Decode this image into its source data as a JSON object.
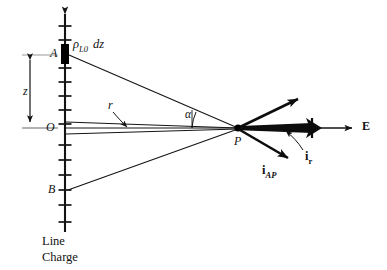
{
  "figure": {
    "background": "#ffffff",
    "ink": "#111111"
  },
  "labels": {
    "point_a": "A",
    "point_o": "O",
    "point_b": "B",
    "point_p": "P",
    "charge_element_rho": "ρ",
    "charge_element_sub": "L0",
    "charge_element_dz": "dz",
    "distance_z": "z",
    "distance_r": "r",
    "angle_alpha": "α",
    "unit_vector_ir": "i",
    "unit_vector_ir_sub": "r",
    "unit_vector_iap": "i",
    "unit_vector_iap_sub": "AP",
    "field_e": "E",
    "caption_line1": "Line",
    "caption_line2": "Charge"
  },
  "geometry": {
    "axis_x": 65,
    "axis_top_y": 8,
    "axis_bottom_y": 232,
    "point_a_y": 54,
    "point_o_y": 128,
    "point_b_y": 190,
    "point_p_x": 238,
    "point_p_y": 128,
    "ticks_y": [
      26,
      40,
      54,
      68,
      82,
      96,
      110,
      124,
      138,
      152,
      166,
      180,
      194,
      208,
      222
    ],
    "e_arrow_start_x": 318,
    "e_arrow_end_x": 358,
    "ir_arrow_end_x": 318,
    "iap_arrow_end": [
      290,
      160
    ],
    "upper_arrow_end": [
      300,
      97
    ]
  },
  "colors": {
    "stroke": "#141414",
    "fill": "#000000",
    "paper": "#ffffff"
  }
}
